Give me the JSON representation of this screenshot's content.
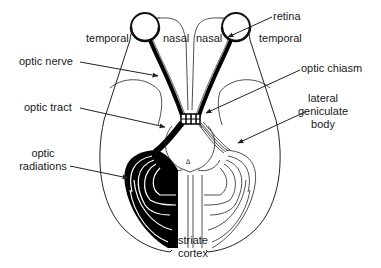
{
  "diagram": {
    "labels": {
      "temporal_left": "temporal",
      "nasal_left": "nasal",
      "nasal_right": "nasal",
      "temporal_right": "temporal",
      "retina": "retina",
      "optic_nerve": "optic nerve",
      "optic_chiasm": "optic chiasm",
      "optic_tract": "optic tract",
      "lateral_geniculate_body_1": "lateral",
      "lateral_geniculate_body_2": "geniculate",
      "lateral_geniculate_body_3": "body",
      "optic_radiations_1": "optic",
      "optic_radiations_2": "radiations",
      "striate_cortex_1": "striate",
      "striate_cortex_2": "cortex"
    },
    "colors": {
      "ink": "#1a1a1a",
      "background": "#ffffff",
      "fibers_left": "#000000"
    }
  }
}
